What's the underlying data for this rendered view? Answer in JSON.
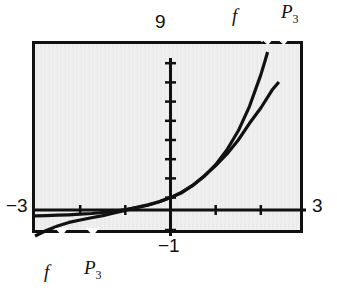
{
  "figure": {
    "kind": "graphing-calculator-window",
    "background_color": "#ebebeb",
    "frame_color": "#111111",
    "curve_color": "#111111"
  },
  "labels": {
    "y_max": "9",
    "y_min": "−1",
    "x_min": "−3",
    "x_max": "3",
    "curve_f": "f",
    "curve_p3_base": "P",
    "curve_p3_sub": "3"
  },
  "chart_data": {
    "type": "line",
    "title": "",
    "xlabel": "",
    "ylabel": "",
    "xlim": [
      -3,
      3
    ],
    "ylim": [
      -1,
      9
    ],
    "grid": false,
    "legend": "inline-curve-labels",
    "x_tick_labels": [
      "-3",
      "3"
    ],
    "y_tick_labels": [
      "9",
      "-1"
    ],
    "x_axis_tick_values": [
      -2,
      -1,
      1,
      2
    ],
    "y_axis_tick_values": [
      1,
      2,
      3,
      4,
      5,
      6,
      7,
      8
    ],
    "annotations": [
      {
        "text": "f",
        "position": "top",
        "points_to_curve": "f"
      },
      {
        "text": "P3",
        "position": "top",
        "points_to_curve": "P3"
      },
      {
        "text": "f",
        "position": "bottom-left",
        "points_to_curve": "f"
      },
      {
        "text": "P3",
        "position": "bottom-left",
        "points_to_curve": "P3"
      }
    ],
    "series": [
      {
        "name": "f",
        "label": "f",
        "description": "exponential-like function, f(x) = e^x",
        "x": [
          -3.0,
          -2.75,
          -2.5,
          -2.25,
          -2.0,
          -1.75,
          -1.5,
          -1.25,
          -1.0,
          -0.75,
          -0.5,
          -0.25,
          0.0,
          0.25,
          0.5,
          0.75,
          1.0,
          1.25,
          1.5,
          1.75,
          2.0,
          2.1,
          2.15
        ],
        "values": [
          0.0498,
          0.0639,
          0.0821,
          0.1054,
          0.1353,
          0.1738,
          0.2231,
          0.2865,
          0.3679,
          0.4724,
          0.6065,
          0.7788,
          1.0,
          1.284,
          1.6487,
          2.117,
          2.7183,
          3.4903,
          4.4817,
          5.7546,
          7.3891,
          8.1662,
          8.5849
        ]
      },
      {
        "name": "P3",
        "label": "P3",
        "description": "third-degree Taylor polynomial of f at 0: 1 + x + x^2/2 + x^3/6",
        "x": [
          -3.0,
          -2.75,
          -2.5,
          -2.25,
          -2.0,
          -1.75,
          -1.5,
          -1.25,
          -1.0,
          -0.75,
          -0.5,
          -0.25,
          0.0,
          0.25,
          0.5,
          0.75,
          1.0,
          1.25,
          1.5,
          1.75,
          2.0,
          2.25,
          2.4
        ],
        "values": [
          -1.0,
          -0.7135,
          -0.4792,
          -0.293,
          -0.1667,
          -0.0534,
          0.0625,
          0.1992,
          0.3333,
          0.4961,
          0.625,
          0.7839,
          1.0,
          1.2578,
          1.6458,
          2.1406,
          2.6667,
          3.2734,
          4.0,
          4.8672,
          5.6667,
          6.5977,
          7.024
        ]
      }
    ]
  }
}
